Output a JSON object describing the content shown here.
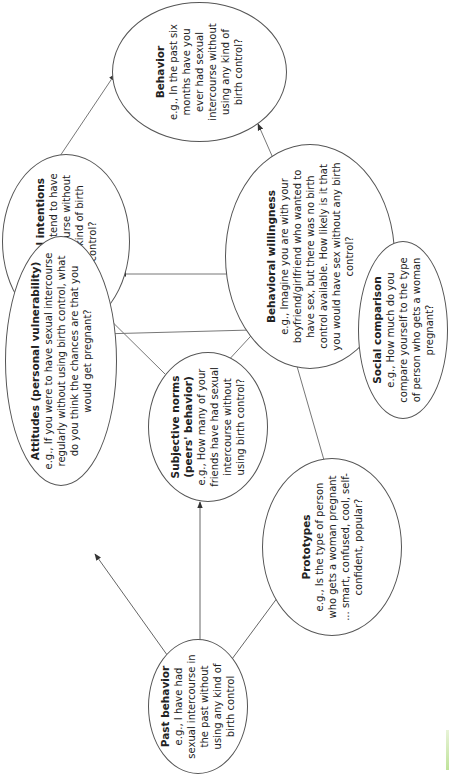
{
  "diagram": {
    "orientation": "rotated-90-ccw",
    "nodes": [
      {
        "id": "behavior",
        "title": "Behavior",
        "body": "e.g., In the past six months have you ever had sexual intercourse without using any kind of birth control?"
      },
      {
        "id": "intentions",
        "title": "Behavioral intentions",
        "body": "e.g., Do you intend to have sexual intercourse without using any kind of birth control?"
      },
      {
        "id": "willingness",
        "title": "Behavioral willingness",
        "body": "e.g., Imagine you are with your boyfriend/girlfriend who wanted to have sex, but there was no birth control available. How likely is it that you would have sex without any birth control?"
      },
      {
        "id": "social",
        "title": "Social comparison",
        "body": "e.g., How much do you compare yourself to the type of person who gets a woman pregnant?"
      },
      {
        "id": "attitudes",
        "title": "Attitudes (personal vulnerability)",
        "body": "e.g., If you were to have sexual intercourse regularly without using birth control, what do you think the chances are that you would get pregnant?"
      },
      {
        "id": "norms",
        "title": "Subjective norms (peers' behavior)",
        "body": "e.g., How many of your friends have had sexual intercourse without using birth control?"
      },
      {
        "id": "prototypes",
        "title": "Prototypes",
        "body": "e.g., Is the type of person who gets a woman pregnant ... smart, confused, cool, self-confident, popular?"
      },
      {
        "id": "past",
        "title": "Past behavior",
        "body": "e.g., I have had sexual intercourse in the past without using any kind of birth control"
      }
    ],
    "edges": [
      {
        "from": "past",
        "to": "attitudes"
      },
      {
        "from": "past",
        "to": "norms"
      },
      {
        "from": "past",
        "to": "prototypes"
      },
      {
        "from": "attitudes",
        "to": "intentions"
      },
      {
        "from": "attitudes",
        "to": "willingness"
      },
      {
        "from": "norms",
        "to": "intentions"
      },
      {
        "from": "norms",
        "to": "willingness"
      },
      {
        "from": "prototypes",
        "to": "willingness"
      },
      {
        "from": "social",
        "to": "willingness"
      },
      {
        "from": "willingness",
        "to": "intentions"
      },
      {
        "from": "willingness",
        "to": "behavior"
      },
      {
        "from": "intentions",
        "to": "behavior"
      }
    ],
    "colors": {
      "stroke": "#555555",
      "text": "#222222",
      "background": "#ffffff"
    }
  }
}
